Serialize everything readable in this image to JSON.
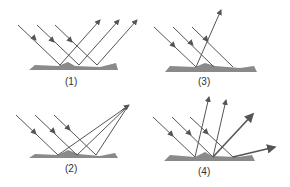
{
  "panels": [
    {
      "id": "1",
      "label": "(1)"
    },
    {
      "id": "2",
      "label": "(2)"
    },
    {
      "id": "3",
      "label": "(3)"
    },
    {
      "id": "4",
      "label": "(4)"
    }
  ],
  "colors": {
    "ray": "#555555",
    "surface": "#8a8a8a",
    "label": "#333333"
  }
}
